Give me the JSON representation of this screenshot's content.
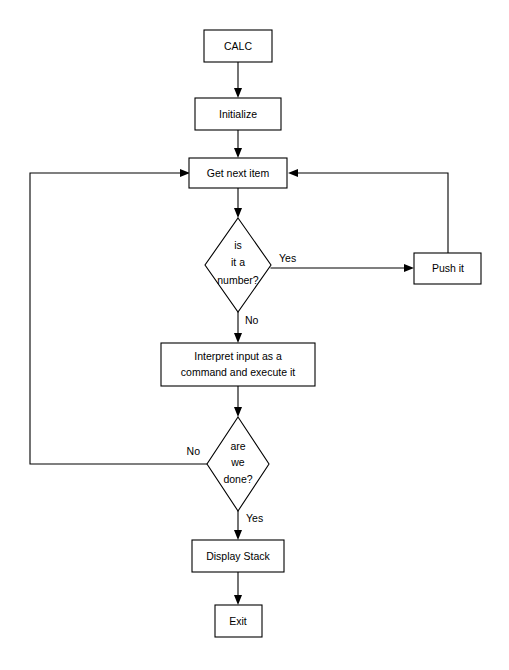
{
  "diagram": {
    "type": "flowchart",
    "background_color": "#ffffff",
    "line_color": "#000000",
    "node_fill": "#ffffff",
    "nodes": [
      {
        "id": "calc",
        "shape": "process",
        "label": "CALC",
        "x": 238,
        "y": 46,
        "w": 68,
        "h": 32
      },
      {
        "id": "init",
        "shape": "process",
        "label": "Initialize",
        "x": 238,
        "y": 114,
        "w": 86,
        "h": 32
      },
      {
        "id": "getnext",
        "shape": "process",
        "label": "Get next item",
        "x": 238,
        "y": 173,
        "w": 98,
        "h": 30
      },
      {
        "id": "isnumber",
        "shape": "decision",
        "label_lines": [
          "is",
          "it a",
          "number?"
        ],
        "x": 238,
        "y": 265,
        "w": 66,
        "h": 94
      },
      {
        "id": "pushit",
        "shape": "process",
        "label": "Push it",
        "x": 448,
        "y": 268,
        "w": 67,
        "h": 31
      },
      {
        "id": "interpret",
        "shape": "process",
        "label_lines": [
          "Interpret input as a",
          "command and execute it"
        ],
        "x": 238,
        "y": 364,
        "w": 154,
        "h": 43
      },
      {
        "id": "aredone",
        "shape": "decision",
        "label_lines": [
          "are",
          "we",
          "done?"
        ],
        "x": 238,
        "y": 464,
        "w": 62,
        "h": 94
      },
      {
        "id": "display",
        "shape": "process",
        "label": "Display Stack",
        "x": 238,
        "y": 556,
        "w": 92,
        "h": 32
      },
      {
        "id": "exit",
        "shape": "process",
        "label": "Exit",
        "x": 238,
        "y": 621,
        "w": 47,
        "h": 32
      }
    ],
    "edges": [
      {
        "id": "e-calc-init",
        "from": "calc",
        "to": "init",
        "label": ""
      },
      {
        "id": "e-init-getnext",
        "from": "init",
        "to": "getnext",
        "label": ""
      },
      {
        "id": "e-getnext-isnumber",
        "from": "getnext",
        "to": "isnumber",
        "label": ""
      },
      {
        "id": "e-isnumber-pushit",
        "from": "isnumber",
        "to": "pushit",
        "label": "Yes"
      },
      {
        "id": "e-pushit-getnext",
        "from": "pushit",
        "to": "getnext",
        "label": ""
      },
      {
        "id": "e-isnumber-interpret",
        "from": "isnumber",
        "to": "interpret",
        "label": "No"
      },
      {
        "id": "e-interpret-aredone",
        "from": "interpret",
        "to": "aredone",
        "label": ""
      },
      {
        "id": "e-aredone-getnext",
        "from": "aredone",
        "to": "getnext",
        "label": "No"
      },
      {
        "id": "e-aredone-display",
        "from": "aredone",
        "to": "display",
        "label": "Yes"
      },
      {
        "id": "e-display-exit",
        "from": "display",
        "to": "exit",
        "label": ""
      }
    ],
    "edge_labels": {
      "yes_number": "Yes",
      "no_number": "No",
      "no_done": "No",
      "yes_done": "Yes"
    }
  }
}
